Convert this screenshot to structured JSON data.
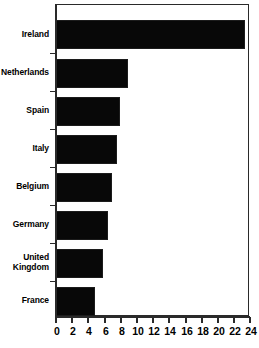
{
  "chart_data": {
    "type": "bar",
    "orientation": "horizontal",
    "title": "",
    "subtitle": "",
    "xlabel": "",
    "ylabel": "",
    "categories": [
      "Ireland",
      "Netherlands",
      "Spain",
      "Italy",
      "Belgium",
      "Germany",
      "United Kingdom",
      "France"
    ],
    "values": [
      23.5,
      9.0,
      8.0,
      7.7,
      7.0,
      6.5,
      5.9,
      4.9
    ],
    "xlim": [
      0,
      24
    ],
    "xticks": [
      0,
      2,
      4,
      6,
      8,
      10,
      12,
      14,
      16,
      18,
      20,
      22,
      24
    ],
    "xtick_labels": [
      "0",
      "2",
      "4",
      "6",
      "8",
      "10",
      "12",
      "14",
      "16",
      "18",
      "20",
      "22",
      "24"
    ],
    "grid": false,
    "legend": null,
    "legend_position": "none",
    "bar_color": "#080808",
    "bar_edge_color": "#1c1c1c",
    "axis_color": "#2a2a2a",
    "background": "#ffffff",
    "annotations": []
  },
  "labels": {
    "ireland": "Ireland",
    "netherlands": "Netherlands",
    "spain": "Spain",
    "italy": "Italy",
    "belgium": "Belgium",
    "germany": "Germany",
    "united_kingdom_line1": "United",
    "united_kingdom_line2": "Kingdom",
    "france": "France"
  }
}
